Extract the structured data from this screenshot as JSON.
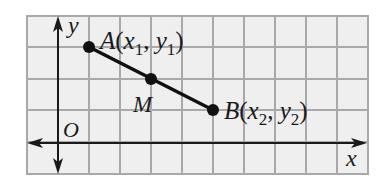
{
  "diagram": {
    "type": "coordinate-grid",
    "grid": {
      "x0": 27,
      "y0": 16,
      "cols": 11,
      "rows": 5,
      "cell_w": 31,
      "cell_h": 31.6,
      "width": 341,
      "height": 158,
      "line_color": "#a9a9a9",
      "fill": "#efefef"
    },
    "axes": {
      "x_label": "x",
      "y_label": "y",
      "origin_label": "O",
      "x_axis_y": 143,
      "y_axis_x": 58,
      "color": "#1a1a1a"
    },
    "points": [
      {
        "id": "A",
        "name": "A",
        "sub_x": "1",
        "sub_y": "1",
        "label": "A(x1, y1)",
        "cx": 89,
        "cy": 47
      },
      {
        "id": "M",
        "name": "M",
        "label": "M",
        "cx": 151,
        "cy": 79
      },
      {
        "id": "B",
        "name": "B",
        "sub_x": "2",
        "sub_y": "2",
        "label": "B(x2, y2)",
        "cx": 213,
        "cy": 110
      }
    ],
    "segment": {
      "from": "A",
      "to": "B",
      "color": "#111111"
    }
  }
}
